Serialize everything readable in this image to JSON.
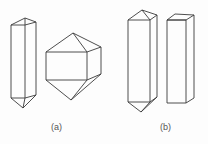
{
  "figure": {
    "panels": [
      {
        "id": "a",
        "label": "(a)",
        "description": "Elongated prism with pyramidal terminations and a short bipyramidal crystal"
      },
      {
        "id": "b",
        "label": "(b)",
        "description": "Elongated prism with pyramidal terminations and a plain rectangular prism"
      }
    ],
    "stroke_color": "#3a3a3a",
    "background": "#fdfdfd"
  }
}
